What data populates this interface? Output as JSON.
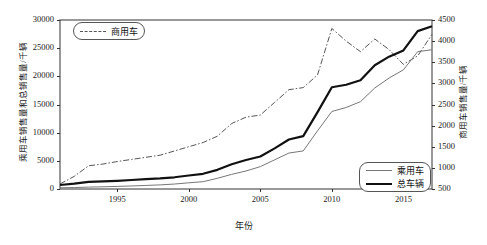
{
  "chart_data": {
    "type": "line",
    "title": "",
    "xlabel": "年份",
    "ylabel_left": "乘用车销售量和总销售量/千辆",
    "ylabel_right": "商用车销售量/千辆",
    "grid": false,
    "xlim": [
      1991,
      2017
    ],
    "ylim_left": [
      0,
      30000
    ],
    "ylim_right": [
      500,
      4500
    ],
    "xticks": [
      1995,
      2000,
      2005,
      2010,
      2015
    ],
    "yticks_left": [
      0,
      5000,
      10000,
      15000,
      20000,
      25000,
      30000
    ],
    "yticks_right": [
      500,
      1000,
      1500,
      2000,
      2500,
      3000,
      3500,
      4000,
      4500
    ],
    "x": [
      1991,
      1992,
      1993,
      1994,
      1995,
      1996,
      1997,
      1998,
      1999,
      2000,
      2001,
      2002,
      2003,
      2004,
      2005,
      2006,
      2007,
      2008,
      2009,
      2010,
      2011,
      2012,
      2013,
      2014,
      2015,
      2016,
      2017
    ],
    "series": [
      {
        "name": "商用车",
        "axis": "right",
        "style": "dash-dot",
        "color": "#555555",
        "values": [
          620,
          800,
          1050,
          1090,
          1150,
          1200,
          1250,
          1300,
          1400,
          1500,
          1600,
          1750,
          2050,
          2200,
          2250,
          2550,
          2850,
          2900,
          3200,
          4300,
          4000,
          3750,
          4050,
          3800,
          3450,
          3650,
          4160
        ]
      },
      {
        "name": "乘用车",
        "axis": "left",
        "style": "thin-solid",
        "color": "#777777",
        "values": [
          210,
          260,
          340,
          390,
          460,
          540,
          630,
          730,
          880,
          1100,
          1300,
          1900,
          2600,
          3200,
          3970,
          5180,
          6380,
          6760,
          10330,
          13760,
          14470,
          15500,
          17930,
          19700,
          21150,
          24380,
          24720
        ]
      },
      {
        "name": "总车辆",
        "axis": "left",
        "style": "thick-solid",
        "color": "#111111",
        "values": [
          710,
          950,
          1270,
          1350,
          1450,
          1600,
          1750,
          1880,
          2080,
          2400,
          2700,
          3400,
          4400,
          5150,
          5760,
          7210,
          8790,
          9380,
          13640,
          18060,
          18500,
          19300,
          21980,
          23490,
          24600,
          28030,
          28880
        ]
      }
    ]
  },
  "legend_top": {
    "items": [
      {
        "label": "商用车",
        "style": "dashdot"
      }
    ]
  },
  "legend_bottom": {
    "items": [
      {
        "label": "乘用车",
        "style": "thin"
      },
      {
        "label": "总车辆",
        "style": "thick"
      }
    ]
  }
}
